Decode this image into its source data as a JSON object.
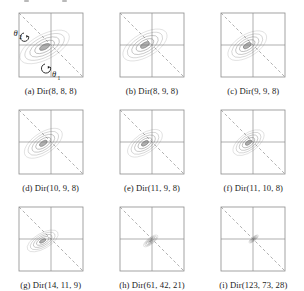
{
  "figure": {
    "kind": "contour-plot-grid",
    "rows": 3,
    "cols": 3,
    "axis_labels": {
      "x": "θ₁",
      "y": "θ₂"
    },
    "frame_color": "#8c8c8c",
    "gridline_color": "#8c8c8c",
    "simplex_line_color": "#a8a8a8",
    "simplex_line_style": "dashed",
    "contour_color": "#7a7a7a",
    "background": "#ffffff"
  },
  "chart_data": {
    "type": "contour",
    "title": "",
    "xlabel": "θ₁",
    "ylabel": "θ₂",
    "xlim": [
      0,
      1
    ],
    "ylim": [
      0,
      1
    ],
    "grid": true,
    "legend": "none",
    "annotations": [
      {
        "panel": "a",
        "text": "θ₂",
        "position": "left-upper",
        "arrow": "curved"
      },
      {
        "panel": "a",
        "text": "θ₁",
        "position": "bottom-center",
        "arrow": "curved"
      }
    ],
    "panels": [
      {
        "id": "a",
        "label": "(a) Dir(8, 8, 8)",
        "distribution": "Dirichlet",
        "alpha": [
          8,
          8,
          8
        ],
        "mode_x": 0.4,
        "mode_y": 0.47,
        "spread": 1.0,
        "tilt_deg": -28,
        "elongation": 1.7,
        "levels": 5
      },
      {
        "id": "b",
        "label": "(b) Dir(8, 9, 8)",
        "distribution": "Dirichlet",
        "alpha": [
          8,
          9,
          8
        ],
        "mode_x": 0.39,
        "mode_y": 0.5,
        "spread": 0.95,
        "tilt_deg": -30,
        "elongation": 1.62,
        "levels": 5
      },
      {
        "id": "c",
        "label": "(c) Dir(9, 9, 8)",
        "distribution": "Dirichlet",
        "alpha": [
          9,
          9,
          8
        ],
        "mode_x": 0.41,
        "mode_y": 0.49,
        "spread": 0.88,
        "tilt_deg": -32,
        "elongation": 1.55,
        "levels": 5
      },
      {
        "id": "d",
        "label": "(d) Dir(10, 9, 8)",
        "distribution": "Dirichlet",
        "alpha": [
          10,
          9,
          8
        ],
        "mode_x": 0.38,
        "mode_y": 0.48,
        "spread": 0.85,
        "tilt_deg": -34,
        "elongation": 1.6,
        "levels": 5
      },
      {
        "id": "e",
        "label": "(e) Dir(11, 9, 8)",
        "distribution": "Dirichlet",
        "alpha": [
          11,
          9,
          8
        ],
        "mode_x": 0.39,
        "mode_y": 0.48,
        "spread": 0.8,
        "tilt_deg": -34,
        "elongation": 1.55,
        "levels": 5
      },
      {
        "id": "f",
        "label": "(f) Dir(11, 10, 8)",
        "distribution": "Dirichlet",
        "alpha": [
          11,
          10,
          8
        ],
        "mode_x": 0.43,
        "mode_y": 0.49,
        "spread": 0.74,
        "tilt_deg": -36,
        "elongation": 1.52,
        "levels": 5
      },
      {
        "id": "g",
        "label": "(g) Dir(14, 11, 9)",
        "distribution": "Dirichlet",
        "alpha": [
          14,
          11,
          9
        ],
        "mode_x": 0.37,
        "mode_y": 0.47,
        "spread": 0.62,
        "tilt_deg": -30,
        "elongation": 1.75,
        "levels": 5
      },
      {
        "id": "h",
        "label": "(h) Dir(61, 42, 21)",
        "distribution": "Dirichlet",
        "alpha": [
          61,
          42,
          21
        ],
        "mode_x": 0.48,
        "mode_y": 0.47,
        "spread": 0.26,
        "tilt_deg": -38,
        "elongation": 2.1,
        "levels": 5
      },
      {
        "id": "i",
        "label": "(i) Dir(123, 73, 28)",
        "distribution": "Dirichlet",
        "alpha": [
          123,
          73,
          28
        ],
        "mode_x": 0.51,
        "mode_y": 0.5,
        "spread": 0.16,
        "tilt_deg": -40,
        "elongation": 2.3,
        "levels": 5
      }
    ]
  }
}
